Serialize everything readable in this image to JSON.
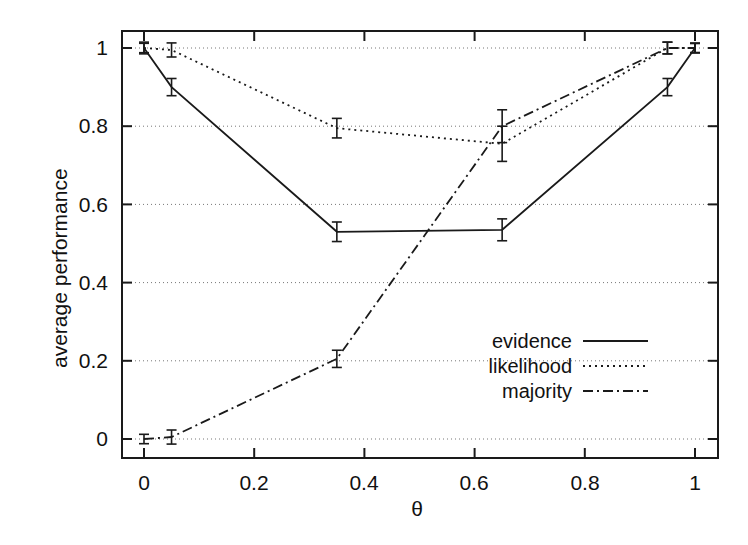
{
  "chart_data": {
    "type": "line",
    "title": "",
    "xlabel": "θ",
    "ylabel": "average performance",
    "xlim": [
      -0.03,
      1.03
    ],
    "ylim": [
      -0.05,
      1.06
    ],
    "xticks": [
      "0",
      "0.2",
      "0.4",
      "0.6",
      "0.8",
      "1"
    ],
    "xtick_values": [
      0,
      0.2,
      0.4,
      0.6,
      0.8,
      1
    ],
    "yticks": [
      "0",
      "0.2",
      "0.4",
      "0.6",
      "0.8",
      "1"
    ],
    "ytick_values": [
      0,
      0.2,
      0.4,
      0.6,
      0.8,
      1
    ],
    "grid": "horizontal-dotted",
    "legend_position": "inside-lower-right",
    "x": [
      0,
      0.05,
      0.35,
      0.65,
      0.95,
      1
    ],
    "series": [
      {
        "name": "evidence",
        "style": "solid",
        "values": [
          1.0,
          0.9,
          0.53,
          0.535,
          0.9,
          1.0
        ],
        "errors": [
          0.015,
          0.022,
          0.025,
          0.028,
          0.022,
          0.012
        ]
      },
      {
        "name": "likelihood",
        "style": "dotted",
        "values": [
          1.0,
          0.995,
          0.795,
          0.755,
          1.0,
          1.0
        ],
        "errors": [
          0.012,
          0.018,
          0.025,
          0.045,
          0.015,
          0.012
        ]
      },
      {
        "name": "majority",
        "style": "dashdot",
        "values": [
          0.0,
          0.005,
          0.205,
          0.8,
          1.0,
          1.0
        ],
        "errors": [
          0.012,
          0.018,
          0.022,
          0.042,
          0.015,
          0.012
        ]
      }
    ]
  },
  "legend": {
    "items": [
      {
        "label": "evidence",
        "style": "solid"
      },
      {
        "label": "likelihood",
        "style": "dotted"
      },
      {
        "label": "majority",
        "style": "dashdot"
      }
    ]
  },
  "colors": {
    "axis": "#1a1a1a",
    "grid": "#777777",
    "series": "#1a1a1a",
    "background": "#ffffff"
  }
}
